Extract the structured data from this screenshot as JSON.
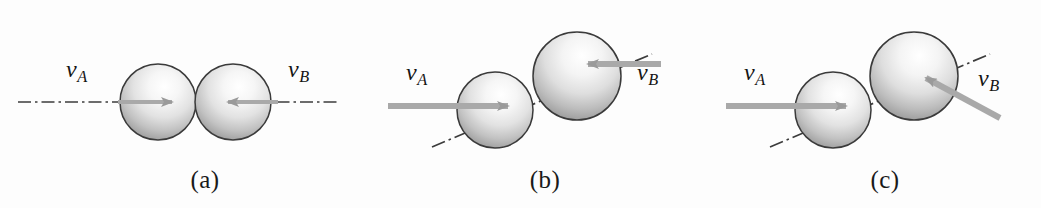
{
  "figure": {
    "background_color": "#fdfdfd",
    "sphere_outline_color": "#3a3a3a",
    "sphere_light_color": "#fbfbfb",
    "sphere_shadow_color": "#8a8a8a",
    "arrow_color": "#a9a9a9",
    "axis_color": "#3c3c3c",
    "label_color": "#141414",
    "width": 1041,
    "height": 208
  },
  "panels": [
    {
      "id": "a",
      "caption": "(a)",
      "description": "head-on collision, line of impact collinear with both velocities",
      "label_a": "v",
      "sub_a": "A",
      "label_b": "v",
      "sub_b": "B",
      "arrow_a_direction": "right",
      "arrow_b_direction": "left",
      "axis_angle_deg": 0,
      "sphere_a": {
        "cx": 158,
        "cy": 102,
        "r": 38
      },
      "sphere_b": {
        "cx": 233,
        "cy": 102,
        "r": 38
      }
    },
    {
      "id": "b",
      "caption": "(b)",
      "description": "oblique impact, line of impact inclined, both velocities horizontal",
      "label_a": "v",
      "sub_a": "A",
      "label_b": "v",
      "sub_b": "B",
      "arrow_a_direction": "right",
      "arrow_b_direction": "left",
      "axis_angle_deg": -23,
      "sphere_a": {
        "cx": 495,
        "cy": 110,
        "r": 38
      },
      "sphere_b": {
        "cx": 577,
        "cy": 76,
        "r": 44
      }
    },
    {
      "id": "c",
      "caption": "(c)",
      "description": "oblique impact, velocity of B inclined along a different direction",
      "label_a": "v",
      "sub_a": "A",
      "label_b": "v",
      "sub_b": "B",
      "arrow_a_direction": "right",
      "arrow_b_direction": "up-left-diagonal",
      "axis_angle_deg": -23,
      "sphere_a": {
        "cx": 833,
        "cy": 110,
        "r": 38
      },
      "sphere_b": {
        "cx": 914,
        "cy": 76,
        "r": 44
      }
    }
  ],
  "captions": {
    "a": "(a)",
    "b": "(b)",
    "c": "(c)"
  },
  "labels": {
    "a_left": "v",
    "a_left_sub": "A",
    "a_right": "v",
    "a_right_sub": "B",
    "b_left": "v",
    "b_left_sub": "A",
    "b_right": "v",
    "b_right_sub": "B",
    "c_left": "v",
    "c_left_sub": "A",
    "c_right": "v",
    "c_right_sub": "B"
  }
}
